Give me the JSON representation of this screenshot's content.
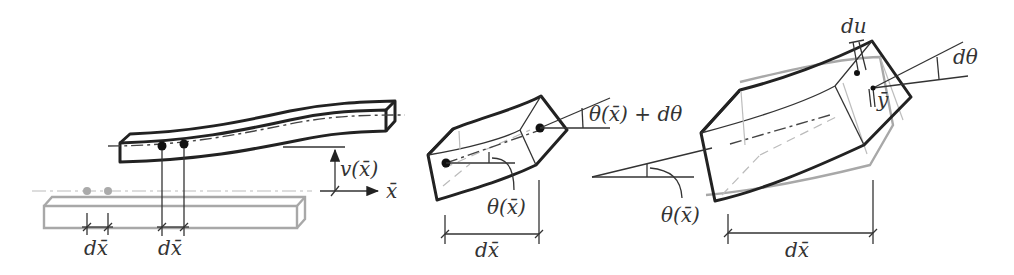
{
  "diagram": {
    "type": "beam-bending-kinematics",
    "panels": [
      {
        "id": "deflected-beam",
        "description": "Undeformed beam (grey) and deflected beam (black) with two marked points a distance dx apart",
        "labels": {
          "deflection": "v(x̄)",
          "axis": "x̄",
          "dx_undeformed": "dx̄",
          "dx_deformed": "dx̄"
        }
      },
      {
        "id": "rotated-segment",
        "description": "Beam segment of length dx rotated by theta at left and theta + dtheta at right",
        "labels": {
          "rotation_right": "θ(x̄) + dθ",
          "rotation_left": "θ(x̄)",
          "length": "dx̄"
        }
      },
      {
        "id": "segment-detail",
        "description": "Enlarged segment showing cross-section rotation dtheta, axial displacement du at distance y from neutral axis",
        "labels": {
          "displacement": "du",
          "increment_angle": "dθ",
          "fiber_offset": "ȳ",
          "rotation": "θ(x̄)",
          "length": "dx̄"
        }
      }
    ],
    "colors": {
      "deformed": "#222222",
      "undeformed": "#a8a8a8",
      "background": "#ffffff"
    }
  }
}
